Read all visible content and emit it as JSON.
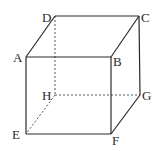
{
  "diagram": {
    "type": "cube",
    "colors": {
      "edge": "#2a2a2a",
      "hidden_edge": "#555555",
      "background": "#ffffff"
    },
    "vertices": {
      "A": {
        "label": "A",
        "x": 26,
        "y": 57,
        "lx": 13,
        "ly": 62
      },
      "B": {
        "label": "B",
        "x": 111,
        "y": 57,
        "lx": 113,
        "ly": 66
      },
      "C": {
        "label": "C",
        "x": 139,
        "y": 16,
        "lx": 141,
        "ly": 22
      },
      "D": {
        "label": "D",
        "x": 55,
        "y": 16,
        "lx": 42,
        "ly": 22
      },
      "E": {
        "label": "E",
        "x": 26,
        "y": 134,
        "lx": 12,
        "ly": 139
      },
      "F": {
        "label": "F",
        "x": 111,
        "y": 134,
        "lx": 112,
        "ly": 145
      },
      "G": {
        "label": "G",
        "x": 140,
        "y": 95,
        "lx": 142,
        "ly": 100
      },
      "H": {
        "label": "H",
        "x": 55,
        "y": 95,
        "lx": 42,
        "ly": 100
      }
    },
    "visible_edges": [
      [
        "A",
        "B"
      ],
      [
        "B",
        "C"
      ],
      [
        "C",
        "D"
      ],
      [
        "D",
        "A"
      ],
      [
        "A",
        "E"
      ],
      [
        "B",
        "F"
      ],
      [
        "C",
        "G"
      ],
      [
        "E",
        "F"
      ],
      [
        "F",
        "G"
      ]
    ],
    "hidden_edges": [
      [
        "D",
        "H"
      ],
      [
        "H",
        "G"
      ],
      [
        "H",
        "E"
      ]
    ]
  }
}
